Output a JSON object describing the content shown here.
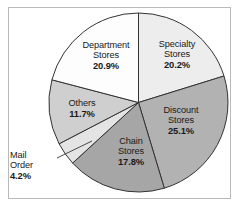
{
  "figure": {
    "frame_color": "#b9b9b9",
    "background": "#ffffff"
  },
  "chart_data": {
    "type": "pie",
    "title": "",
    "subtitle": "",
    "xlabel": "",
    "ylabel": "",
    "legend_position": "none",
    "grid": false,
    "start_angle_deg": 0,
    "direction": "clockwise",
    "unit": "%",
    "categories": [
      "Specialty Stores",
      "Discount Stores",
      "Chain Stores",
      "Mail Order",
      "Others",
      "Department Stores"
    ],
    "values": [
      20.2,
      25.1,
      17.8,
      4.2,
      11.7,
      20.9
    ],
    "colors": [
      "#ededed",
      "#b2b2b2",
      "#a6a6a6",
      "#e4e4e4",
      "#cfcfcf",
      "#fdfdfd"
    ],
    "slices": [
      {
        "name": "Specialty Stores",
        "label_line1": "Specialty",
        "label_line2": "Stores",
        "value": 20.2,
        "value_text": "20.2%",
        "color": "#ededed",
        "leader_line": false
      },
      {
        "name": "Discount Stores",
        "label_line1": "Discount",
        "label_line2": "Stores",
        "value": 25.1,
        "value_text": "25.1%",
        "color": "#b2b2b2",
        "leader_line": false
      },
      {
        "name": "Chain Stores",
        "label_line1": "Chain",
        "label_line2": "Stores",
        "value": 17.8,
        "value_text": "17.8%",
        "color": "#a6a6a6",
        "leader_line": false
      },
      {
        "name": "Mail Order",
        "label_line1": "Mail",
        "label_line2": "Order",
        "value": 4.2,
        "value_text": "4.2%",
        "color": "#e4e4e4",
        "leader_line": true
      },
      {
        "name": "Others",
        "label_line1": "Others",
        "label_line2": "",
        "value": 11.7,
        "value_text": "11.7%",
        "color": "#cfcfcf",
        "leader_line": false
      },
      {
        "name": "Department Stores",
        "label_line1": "Department",
        "label_line2": "Stores",
        "value": 20.9,
        "value_text": "20.9%",
        "color": "#fdfdfd",
        "leader_line": false
      }
    ]
  }
}
